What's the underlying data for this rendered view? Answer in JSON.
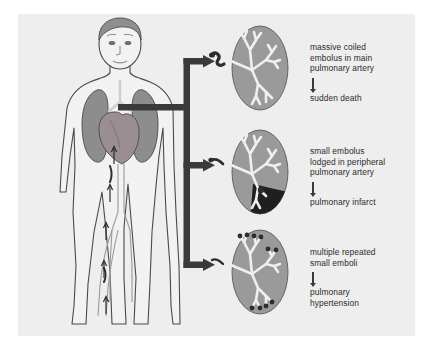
{
  "figure": {
    "background_color": "#eeeeee",
    "page_color": "#ffffff"
  },
  "colors": {
    "panel": "#eeeeee",
    "skin": "#f2f2f2",
    "outline": "#4a4a4a",
    "lung_organ": "#8d8d8d",
    "heart": "#9a8e92",
    "lung_illustration": "#9a9a9a",
    "vessel": "#efefef",
    "embolus": "#2d2d2d",
    "infarct": "#1f1f1f",
    "arrow": "#3a3a3a",
    "text": "#2b2b2b"
  },
  "body_figure": {
    "name": "human-body-with-pulmonary-circulation",
    "parts": [
      "head",
      "torso",
      "arms",
      "legs",
      "right-lung",
      "left-lung",
      "heart",
      "inferior-vena-cava",
      "leg-veins",
      "deep-vein-thrombus"
    ],
    "flow_arrows_direction": "upward",
    "flow_arrow_count": 5
  },
  "trunk_arrow": {
    "name": "embolus-travel-arrow",
    "branch_count": 3,
    "color": "#3a3a3a"
  },
  "scenarios": [
    {
      "id": "massive",
      "cause": "massive coiled\nembolus in main\npulmonary artery",
      "outcome": "sudden death",
      "lung": {
        "name": "lung-massive-embolus",
        "embolus_type": "large-coiled-embolus-at-hilum",
        "embolus_count": 1,
        "infarct": false
      }
    },
    {
      "id": "peripheral",
      "cause": "small embolus\nlodged in peripheral\npulmonary artery",
      "outcome": "pulmonary infarct",
      "lung": {
        "name": "lung-peripheral-embolus",
        "embolus_type": "small-embolus-peripheral",
        "embolus_count": 1,
        "infarct": true,
        "infarct_shape": "wedge",
        "infarct_location": "lower-lateral"
      }
    },
    {
      "id": "repeated",
      "cause": "multiple repeated\nsmall emboli",
      "outcome": "pulmonary\nhypertension",
      "lung": {
        "name": "lung-multiple-emboli",
        "embolus_type": "multiple-small-emboli",
        "embolus_count": 9,
        "infarct": false
      }
    }
  ]
}
